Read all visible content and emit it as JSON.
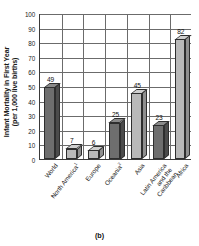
{
  "chart_data": {
    "type": "bar",
    "title": "",
    "subtitle": "",
    "xlabel": "",
    "ylabel": "Infant Mortality in First Year (per 1,000 live births)",
    "ylabel_line1": "Infant Mortality in First Year",
    "ylabel_line2": "(per 1,000 live births)",
    "categories": [
      "World",
      "North America",
      "Europe",
      "Oceania",
      "Asia",
      "Latin America and the Caribbean",
      "Africa"
    ],
    "category_footnotes": [
      "",
      "1",
      "",
      "2",
      "",
      "",
      ""
    ],
    "category_display_lines": [
      [
        "World"
      ],
      [
        "North America"
      ],
      [
        "Europe"
      ],
      [
        "Oceania"
      ],
      [
        "Asia"
      ],
      [
        "Latin America",
        "and the",
        "Caribbean"
      ],
      [
        "Africa"
      ]
    ],
    "values": [
      49,
      7,
      6,
      25,
      45,
      23,
      82
    ],
    "bar_shades": [
      "dark",
      "light",
      "light",
      "dark",
      "light",
      "dark",
      "light"
    ],
    "ylim": [
      0,
      100
    ],
    "ytick_step": 10,
    "ytick_labels": [
      "0",
      "10",
      "20",
      "30",
      "40",
      "50",
      "60",
      "70",
      "80",
      "90",
      "100"
    ],
    "grid": true,
    "grid_horizontal": true,
    "grid_vertical": true,
    "legend": null,
    "legend_position": "none",
    "style": "3d-column",
    "colors": {
      "bar_dark_face": "#6e6e6e",
      "bar_dark_side": "#4b4b4b",
      "bar_dark_top": "#8a8a8a",
      "bar_light_face": "#b9b9b9",
      "bar_light_side": "#8f8f8f",
      "bar_light_top": "#cfcfcf",
      "grid": "#6b6b6b",
      "axis": "#3a3a3a",
      "text": "#1a1a1a",
      "background": "#ffffff"
    }
  },
  "caption": {
    "label": "(b)"
  }
}
